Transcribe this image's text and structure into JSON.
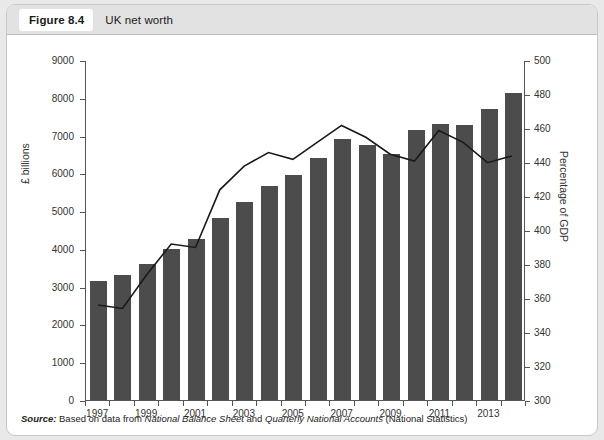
{
  "figure": {
    "number": "Figure 8.4",
    "caption": "UK net worth",
    "source_prefix": "Source:",
    "source_text_1": " Based on data from ",
    "source_italic_1": "National Balance Sheet",
    "source_text_2": " and ",
    "source_italic_2": "Quarterly National Accounts",
    "source_text_3": " (National Statistics)"
  },
  "colors": {
    "bar": "#4c4c4c",
    "line": "#1a1a1a",
    "axis": "#555555",
    "panel_bg": "#ffffff",
    "header_bg": "#e2e2e2",
    "page_bg": "#e9e9e9"
  },
  "chart_data": {
    "type": "bar",
    "title": "UK net worth",
    "xlabel": "",
    "ylabel": "£ billions",
    "y2label": "Percentage of GDP",
    "ylim": [
      0,
      9000
    ],
    "y2lim": [
      300,
      500
    ],
    "ytick_step": 1000,
    "y2tick_step": 20,
    "grid": false,
    "legend": "none",
    "categories": [
      "1997",
      "1998",
      "1999",
      "2000",
      "2001",
      "2002",
      "2003",
      "2004",
      "2005",
      "2006",
      "2007",
      "2008",
      "2009",
      "2010",
      "2011",
      "2012",
      "2013",
      "2014"
    ],
    "xtick_labels": [
      "1997",
      "1999",
      "2001",
      "2003",
      "2005",
      "2007",
      "2009",
      "2011",
      "2013"
    ],
    "yticks": [
      0,
      1000,
      2000,
      3000,
      4000,
      5000,
      6000,
      7000,
      8000,
      9000
    ],
    "y2ticks": [
      300,
      320,
      340,
      360,
      380,
      400,
      420,
      440,
      460,
      480,
      500
    ],
    "series": [
      {
        "name": "UK net worth",
        "type": "bar",
        "axis": "left",
        "unit": "£ billions",
        "values": [
          3150,
          3300,
          3600,
          4000,
          4250,
          4820,
          5250,
          5670,
          5950,
          6400,
          6900,
          6750,
          6500,
          7150,
          7300,
          7280,
          7700,
          8120
        ]
      },
      {
        "name": "Net worth as percentage of GDP",
        "type": "line",
        "axis": "right",
        "unit": "Percentage of GDP",
        "values": [
          356,
          354,
          374,
          392,
          390,
          424,
          438,
          446,
          442,
          452,
          462,
          455,
          445,
          441,
          459,
          452,
          440,
          444
        ]
      }
    ]
  }
}
